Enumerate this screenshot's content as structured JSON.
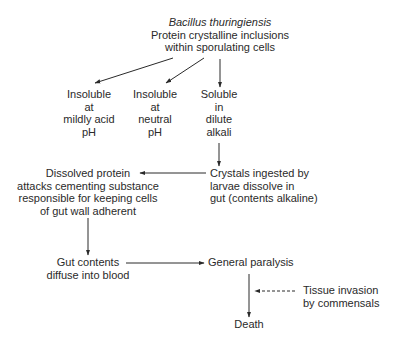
{
  "diagram": {
    "type": "flowchart",
    "nodes": {
      "source": {
        "organism": "Bacillus thuringiensis",
        "lines": [
          "Protein crystalline inclusions",
          "within sporulating cells"
        ]
      },
      "insoluble_acid": {
        "lines": [
          "Insoluble",
          "at",
          "mildly acid",
          "pH"
        ]
      },
      "insoluble_neutral": {
        "lines": [
          "Insoluble",
          "at",
          "neutral",
          "pH"
        ]
      },
      "soluble_alkali": {
        "lines": [
          "Soluble",
          "in",
          "dilute",
          "alkali"
        ]
      },
      "crystals_ingested": {
        "lines": [
          "Crystals ingested by",
          "larvae dissolve in",
          "gut (contents alkaline)"
        ]
      },
      "dissolved_protein": {
        "lines": [
          "Dissolved protein",
          "attacks cementing substance",
          "responsible for keeping cells",
          "of gut wall adherent"
        ]
      },
      "gut_contents": {
        "lines": [
          "Gut contents",
          "diffuse into blood"
        ]
      },
      "general_paralysis": {
        "lines": [
          "General paralysis"
        ]
      },
      "tissue_invasion": {
        "lines": [
          "Tissue invasion",
          "by commensals"
        ]
      },
      "death": {
        "lines": [
          "Death"
        ]
      }
    },
    "edges": [
      {
        "from": "source",
        "to": "insoluble_acid",
        "style": "solid"
      },
      {
        "from": "source",
        "to": "insoluble_neutral",
        "style": "solid"
      },
      {
        "from": "source",
        "to": "soluble_alkali",
        "style": "solid"
      },
      {
        "from": "soluble_alkali",
        "to": "crystals_ingested",
        "style": "solid"
      },
      {
        "from": "crystals_ingested",
        "to": "dissolved_protein",
        "style": "solid"
      },
      {
        "from": "dissolved_protein",
        "to": "gut_contents",
        "style": "solid"
      },
      {
        "from": "gut_contents",
        "to": "general_paralysis",
        "style": "solid"
      },
      {
        "from": "general_paralysis",
        "to": "death",
        "style": "solid"
      },
      {
        "from": "tissue_invasion",
        "to": "death",
        "style": "dashed"
      }
    ]
  }
}
